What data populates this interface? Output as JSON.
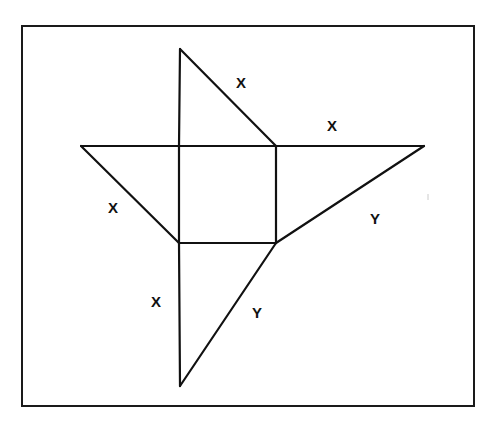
{
  "diagram": {
    "title": "",
    "colors": {
      "line": "#111111",
      "background": "#ffffff",
      "frame": "#1a1a1a"
    },
    "frame": {
      "x": 22,
      "y": 26,
      "width": 452,
      "height": 380
    },
    "square": {
      "x1": 179,
      "y1": 146,
      "x2": 276,
      "y2": 243
    },
    "vertices": {
      "top_apex": [
        180,
        49
      ],
      "left_tip": [
        81,
        146
      ],
      "right_tip": [
        424,
        146
      ],
      "bottom_apex": [
        180,
        386
      ],
      "square_top_left": [
        179,
        146
      ],
      "square_top_right": [
        276,
        146
      ],
      "square_bottom_left": [
        179,
        243
      ],
      "square_bottom_right": [
        276,
        243
      ]
    },
    "labels": [
      {
        "id": "top-hypotenuse",
        "text": "X",
        "x": 241,
        "y": 82
      },
      {
        "id": "right-top-edge",
        "text": "X",
        "x": 332,
        "y": 125
      },
      {
        "id": "left-hypotenuse",
        "text": "X",
        "x": 113,
        "y": 207
      },
      {
        "id": "right-hypotenuse",
        "text": "Y",
        "x": 375,
        "y": 218
      },
      {
        "id": "bottom-left-edge",
        "text": "X",
        "x": 156,
        "y": 301
      },
      {
        "id": "bottom-hypotenuse",
        "text": "Y",
        "x": 257,
        "y": 312
      }
    ]
  }
}
